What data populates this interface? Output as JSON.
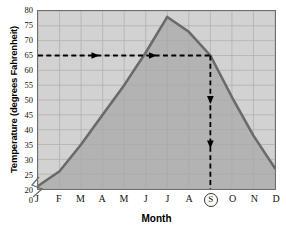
{
  "chart_data": {
    "type": "line",
    "title": "",
    "xlabel": "Month",
    "ylabel": "Temperature (degrees Fahrenheit)",
    "categories": [
      "J",
      "F",
      "M",
      "A",
      "M",
      "J",
      "J",
      "A",
      "S",
      "O",
      "N",
      "D"
    ],
    "category_names": [
      "January",
      "February",
      "March",
      "April",
      "May",
      "June",
      "July",
      "August",
      "September",
      "October",
      "November",
      "December"
    ],
    "values": [
      21,
      26,
      35,
      45,
      55,
      66,
      78,
      73,
      65,
      51,
      38,
      27
    ],
    "series": [
      {
        "name": "Average monthly temperature",
        "values": [
          21,
          26,
          35,
          45,
          55,
          66,
          78,
          73,
          65,
          51,
          38,
          27
        ]
      }
    ],
    "ylim": [
      20,
      80
    ],
    "y_axis_break": true,
    "y_break_label": "0",
    "yticks": [
      20,
      25,
      30,
      35,
      40,
      45,
      50,
      55,
      60,
      65,
      70,
      75,
      80
    ],
    "ytick_labels": [
      "20",
      "25",
      "30",
      "35",
      "40",
      "45",
      "50",
      "55",
      "60",
      "65",
      "70",
      "75",
      "80"
    ],
    "xtick_labels": [
      "J",
      "F",
      "M",
      "A",
      "M",
      "J",
      "J",
      "A",
      "S",
      "O",
      "N",
      "D"
    ],
    "grid": true,
    "legend": "none",
    "fill_under_curve": true,
    "annotations": [
      {
        "kind": "horizontal-guide-line",
        "style": "dashed",
        "y_value": 65,
        "from_x": "J",
        "to_x": "S",
        "arrowheads": 2,
        "arrow_direction": "right"
      },
      {
        "kind": "vertical-guide-line",
        "style": "dashed",
        "x_value": "S",
        "from_y": 65,
        "to_y": 20,
        "arrowheads": 2,
        "arrow_direction": "down"
      },
      {
        "kind": "circled-tick-label",
        "axis": "x",
        "label": "S"
      }
    ],
    "colors": {
      "plot_background": "#d2d2d2",
      "fill_under_curve": "#a8a8a8",
      "curve": "#6a6a6a",
      "gridline": "#b0b0b0",
      "axis": "#6d6d6d",
      "annotation": "#000000",
      "text": "#111111"
    }
  },
  "axis": {
    "y_title": "Temperature (degrees Fahrenheit)",
    "x_title": "Month"
  }
}
